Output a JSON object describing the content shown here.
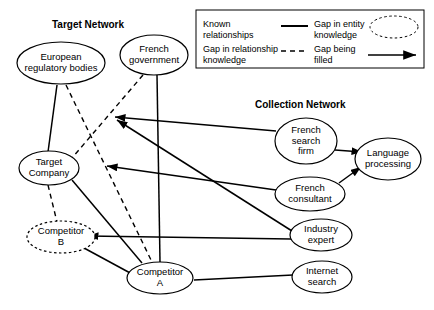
{
  "diagram": {
    "titles": {
      "target_network": "Target Network",
      "collection_network": "Collection Network"
    },
    "legend": {
      "known_relationships": "Known\nrelationships",
      "gap_in_relationship": "Gap in relationship\nknowledge",
      "gap_in_entity": "Gap in entity\nknowledge",
      "gap_being_filled": "Gap being\nfilled"
    },
    "nodes": {
      "european_regulatory_bodies": "European\nregulatory bodies",
      "french_government": "French\ngovernment",
      "target_company": "Target\nCompany",
      "competitor_b": "Competitor\nB",
      "competitor_a": "Competitor\nA",
      "french_search_firm": "French\nsearch\nfirm",
      "french_consultant": "French\nconsultant",
      "language_processing": "Language\nprocessing",
      "industry_expert": "Industry\nexpert",
      "internet_search": "Internet\nsearch"
    },
    "colors": {
      "stroke": "#000000",
      "background": "#ffffff"
    }
  }
}
